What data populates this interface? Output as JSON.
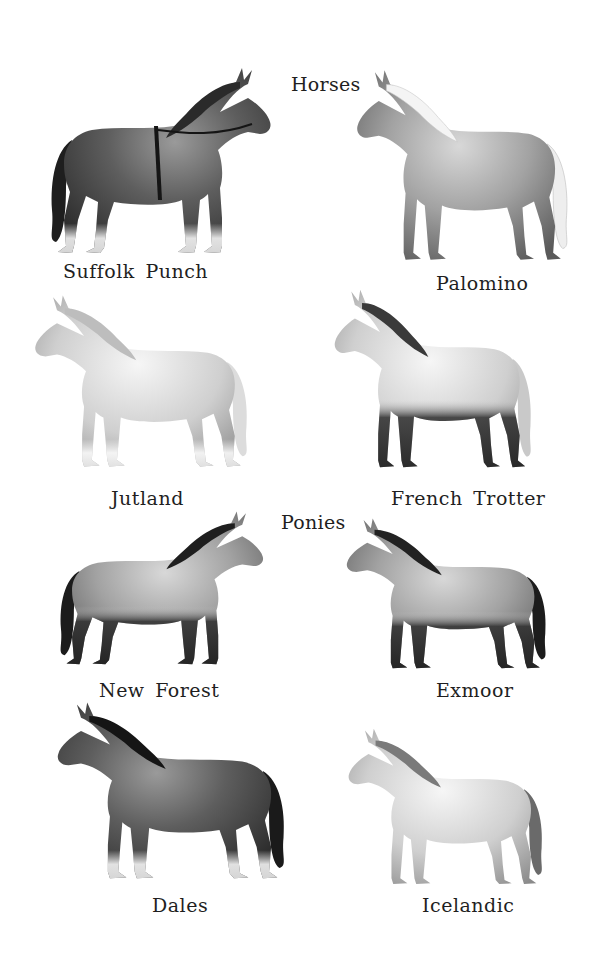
{
  "plate": {
    "sections": [
      {
        "id": "horses",
        "label": "Horses"
      },
      {
        "id": "ponies",
        "label": "Ponies"
      }
    ],
    "breeds": [
      {
        "id": "suffolk-punch",
        "name": "Suffolk Punch",
        "section": "horses",
        "coat": "dark",
        "facing": "right"
      },
      {
        "id": "palomino",
        "name": "Palomino",
        "section": "horses",
        "coat": "light",
        "facing": "left"
      },
      {
        "id": "jutland",
        "name": "Jutland",
        "section": "horses",
        "coat": "light",
        "facing": "left"
      },
      {
        "id": "french-trotter",
        "name": "French Trotter",
        "section": "horses",
        "coat": "light-dark-legs",
        "facing": "left"
      },
      {
        "id": "new-forest",
        "name": "New Forest",
        "section": "ponies",
        "coat": "medium-dark-points",
        "facing": "right"
      },
      {
        "id": "exmoor",
        "name": "Exmoor",
        "section": "ponies",
        "coat": "medium-dark-points",
        "facing": "left"
      },
      {
        "id": "dales",
        "name": "Dales",
        "section": "ponies",
        "coat": "dark",
        "facing": "left"
      },
      {
        "id": "icelandic",
        "name": "Icelandic",
        "section": "ponies",
        "coat": "light",
        "facing": "left"
      }
    ],
    "colors": {
      "background": "#ffffff",
      "text": "#1f1f1f",
      "dark_coat": "#3a3a3a",
      "medium_coat": "#8a8a8a",
      "light_coat": "#d4d4d4"
    }
  }
}
